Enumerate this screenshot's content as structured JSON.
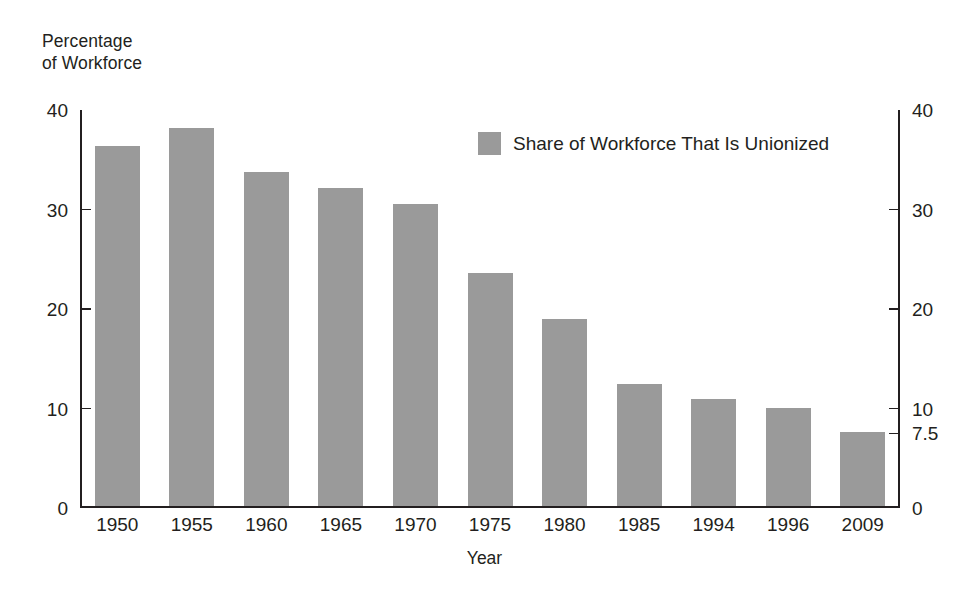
{
  "chart_data": {
    "type": "bar",
    "title": "",
    "ylabel": "Percentage\nof Workforce",
    "xlabel": "Year",
    "categories": [
      "1950",
      "1955",
      "1960",
      "1965",
      "1970",
      "1975",
      "1980",
      "1985",
      "1994",
      "1996",
      "2009"
    ],
    "values": [
      36.2,
      38.0,
      33.6,
      32.0,
      30.4,
      23.5,
      18.8,
      12.3,
      10.8,
      9.9,
      7.5
    ],
    "series": [
      {
        "name": "Share of Workforce That Is Unionized",
        "values": [
          36.2,
          38.0,
          33.6,
          32.0,
          30.4,
          23.5,
          18.8,
          12.3,
          10.8,
          9.9,
          7.5
        ]
      }
    ],
    "ylim": [
      0,
      40
    ],
    "yticks_left": [
      "0",
      "10",
      "20",
      "30",
      "40"
    ],
    "yticks_left_values": [
      0,
      10,
      20,
      30,
      40
    ],
    "yticks_right": [
      "0",
      "7.5",
      "10",
      "20",
      "30",
      "40"
    ],
    "yticks_right_values": [
      0,
      7.5,
      10,
      20,
      30,
      40
    ],
    "grid": false,
    "legend": {
      "position": "top-center",
      "entries": [
        {
          "label": "Share of Workforce That Is Unionized",
          "color": "#9a9a9a"
        }
      ]
    },
    "colors": {
      "bar": "#9a9a9a",
      "axis": "#231f20",
      "text": "#231f20",
      "background": "#ffffff"
    }
  }
}
